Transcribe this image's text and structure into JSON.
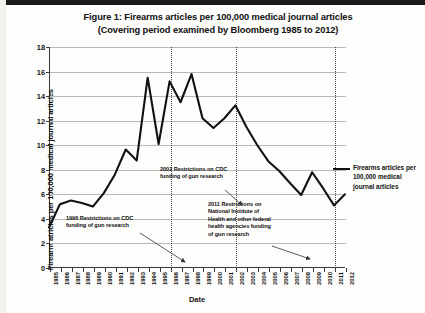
{
  "figure": {
    "title_line1": "Figure 1: Firearms articles per 100,000 medical journal articles",
    "title_line2": "(Covering period examined by Bloomberg 1985 to 2012)"
  },
  "legend": {
    "entry_label": "Firearms articles per 100,000 medical journal articles"
  },
  "annotations": [
    {
      "id": "a1996",
      "text": "1996 Restrictions on CDC funding of gun research",
      "target_year": 1996
    },
    {
      "id": "a2002",
      "text": "2002 Restrictions on CDC funding of gun research",
      "target_year": 2002
    },
    {
      "id": "a2011",
      "text": "2011 Restrictions on National Institute of Health and other federal health agencies funding of gun research",
      "target_year": 2011
    }
  ],
  "chart_data": {
    "type": "line",
    "title": "Figure 1: Firearms articles per 100,000 medical journal articles (Covering period examined by Bloomberg 1985 to 2012)",
    "xlabel": "Date",
    "ylabel": "Firearm atricles per 100,000 medical journal articles",
    "ylim": [
      0,
      18
    ],
    "ytick_step": 2,
    "yticks": [
      0,
      2,
      4,
      6,
      8,
      10,
      12,
      14,
      16,
      18
    ],
    "grid": "horizontal",
    "legend_position": "right",
    "line_color": "#111111",
    "categories": [
      "1985",
      "1986",
      "1987",
      "1988",
      "1989",
      "1990",
      "1991",
      "1992",
      "1993",
      "1994",
      "1995",
      "1996",
      "1997",
      "1998",
      "1999",
      "2000",
      "2001",
      "2002",
      "2003",
      "2004",
      "2005",
      "2006",
      "2007",
      "2008",
      "2009",
      "2010",
      "2011",
      "2012"
    ],
    "series": [
      {
        "name": "Firearms articles per 100,000 medical journal articles",
        "values": [
          3.3,
          5.2,
          5.5,
          5.3,
          5.0,
          6.1,
          7.6,
          9.65,
          8.75,
          15.5,
          10.1,
          15.2,
          13.5,
          15.8,
          12.2,
          11.4,
          12.2,
          13.25,
          11.5,
          10.0,
          8.7,
          7.9,
          6.9,
          5.95,
          7.8,
          6.5,
          5.1,
          6.0
        ]
      }
    ],
    "event_markers": [
      {
        "year": "1996",
        "label": "1996 Restrictions on CDC funding of gun research"
      },
      {
        "year": "2002",
        "label": "2002 Restrictions on CDC funding of gun research"
      },
      {
        "year": "2011",
        "label": "2011 Restrictions on National Institute of Health and other federal health agencies funding of gun research"
      }
    ]
  }
}
